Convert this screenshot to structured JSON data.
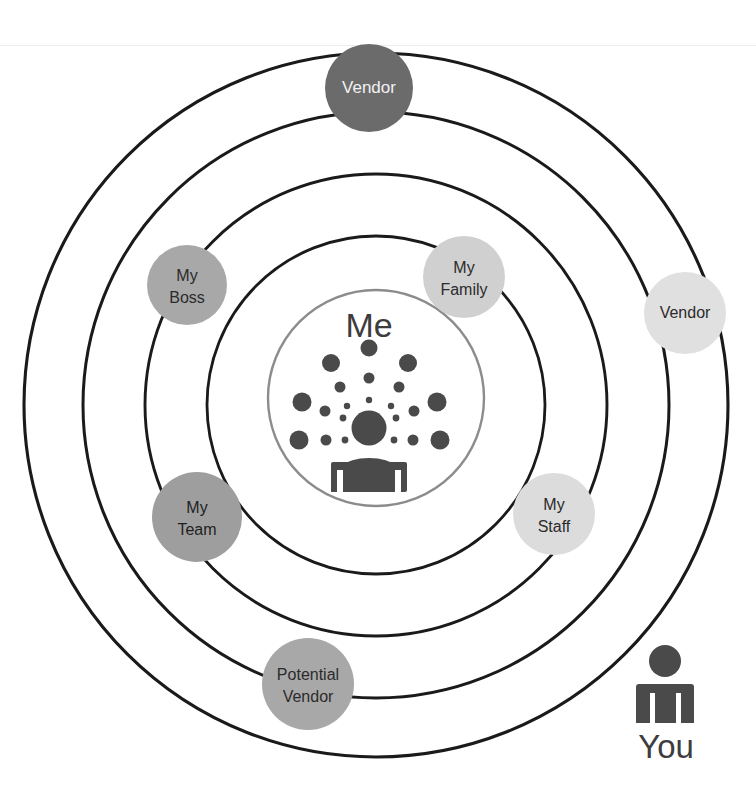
{
  "diagram": {
    "center": {
      "label": "Me",
      "icon": "person-with-radiating-dots-icon",
      "text_color": "#3d3d3d",
      "ring_stroke": "#8c8c8c"
    },
    "rings": [
      {
        "name": "ring-1-outermost",
        "rx": 352,
        "ry": 352,
        "stroke": "#1a1a1a"
      },
      {
        "name": "ring-2",
        "rx": 293,
        "ry": 293,
        "stroke": "#1a1a1a"
      },
      {
        "name": "ring-3",
        "rx": 231,
        "ry": 231,
        "stroke": "#1a1a1a"
      },
      {
        "name": "ring-4",
        "rx": 169,
        "ry": 169,
        "stroke": "#1a1a1a"
      },
      {
        "name": "ring-5-inner",
        "rx": 108,
        "ry": 108,
        "stroke": "#8c8c8c"
      }
    ],
    "nodes": [
      {
        "id": "vendor-top",
        "label": "Vendor",
        "lines": [
          "Vendor"
        ],
        "cx": 369,
        "cy": 88,
        "r": 44,
        "fill": "#6b6b6b",
        "text_color": "#f2f2f2",
        "font_size": 17
      },
      {
        "id": "my-boss",
        "label": "My Boss",
        "lines": [
          "My",
          "Boss"
        ],
        "cx": 187,
        "cy": 285,
        "r": 40,
        "fill": "#a8a8a8",
        "text_color": "#2b2b2b",
        "font_size": 16
      },
      {
        "id": "my-family",
        "label": "My Family",
        "lines": [
          "My",
          "Family"
        ],
        "cx": 464,
        "cy": 277,
        "r": 41,
        "fill": "#d0d0d0",
        "text_color": "#2b2b2b",
        "font_size": 16
      },
      {
        "id": "vendor-right",
        "label": "Vendor",
        "lines": [
          "Vendor"
        ],
        "cx": 685,
        "cy": 313,
        "r": 41,
        "fill": "#e0e0e0",
        "text_color": "#2b2b2b",
        "font_size": 16
      },
      {
        "id": "my-team",
        "label": "My Team",
        "lines": [
          "My",
          "Team"
        ],
        "cx": 197,
        "cy": 517,
        "r": 45,
        "fill": "#9e9e9e",
        "text_color": "#1f1f1f",
        "font_size": 16
      },
      {
        "id": "my-staff",
        "label": "My Staff",
        "lines": [
          "My",
          "Staff"
        ],
        "cx": 554,
        "cy": 514,
        "r": 41,
        "fill": "#dcdcdc",
        "text_color": "#2b2b2b",
        "font_size": 16
      },
      {
        "id": "potential-vendor",
        "label": "Potential Vendor",
        "lines": [
          "Potential",
          "Vendor"
        ],
        "cx": 308,
        "cy": 684,
        "r": 46,
        "fill": "#a8a8a8",
        "text_color": "#2b2b2b",
        "font_size": 16
      }
    ],
    "legend": {
      "label": "You",
      "icon": "person-icon",
      "icon_color": "#4a4a4a",
      "text_color": "#3d3d3d",
      "x": 672,
      "y": 700
    },
    "colors": {
      "background": "#ffffff",
      "ring_dark": "#1a1a1a",
      "ring_light": "#8c8c8c",
      "center_icon": "#4a4a4a"
    }
  }
}
